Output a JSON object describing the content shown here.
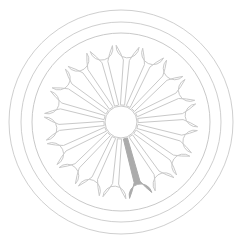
{
  "canvas": {
    "width": 241,
    "height": 250,
    "background": "#ffffff",
    "title": "radial-spoke-wheel-diagram"
  },
  "colors": {
    "outline": "#c9c9c9",
    "outline_outer": "#cfcfcf",
    "fill": "#ffffff",
    "highlight_fill": "#ababab",
    "highlight_stroke": "#ababab"
  },
  "geometry": {
    "center_x": 121,
    "center_y": 122,
    "rim_outer_radius": 112,
    "rim_inner_radius": 100,
    "field_radius": 89,
    "hub_radius": 16,
    "stroke_width": 1
  },
  "petals": {
    "count": 18,
    "start_angle_deg": -85,
    "stem_inner_radius": 17,
    "stem_half_width": 2.1,
    "bulb_center_radius": 76,
    "bulb_radius": 11.5,
    "neck_radius": 62,
    "neck_half_width": 3.0,
    "highlight_index": 8,
    "highlight_label": "selected-spoke"
  },
  "labels": {
    "diagram_name": "Radial spoke wheel",
    "hub_name": "center-hub",
    "rim_name": "outer-rim",
    "selected_spoke_name": "highlighted spoke"
  }
}
